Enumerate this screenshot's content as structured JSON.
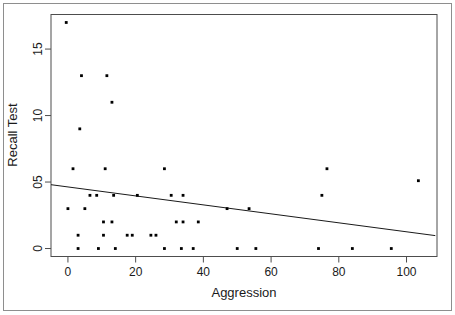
{
  "chart_data": {
    "type": "scatter",
    "title": "",
    "xlabel": "Aggression",
    "ylabel": "Recall Test",
    "xticks": [
      "0",
      "20",
      "40",
      "60",
      "80",
      "100"
    ],
    "xtick_values": [
      0,
      20,
      40,
      60,
      80,
      100
    ],
    "yticks": [
      "0",
      "05",
      "10",
      "15"
    ],
    "ytick_values": [
      0,
      5,
      10,
      15
    ],
    "xlim": [
      -5,
      109
    ],
    "ylim": [
      -0.6,
      17.6
    ],
    "grid": false,
    "legend": null,
    "point_color": "#000000",
    "line_color": "#1a1a1a",
    "axis_color": "#4d4d4d",
    "points": [
      {
        "x": -0.5,
        "y": 17.0
      },
      {
        "x": 4.0,
        "y": 13.0
      },
      {
        "x": 11.5,
        "y": 13.0
      },
      {
        "x": 13.0,
        "y": 11.0
      },
      {
        "x": 3.5,
        "y": 9.0
      },
      {
        "x": 1.5,
        "y": 6.0
      },
      {
        "x": 11.0,
        "y": 6.0
      },
      {
        "x": 28.5,
        "y": 6.0
      },
      {
        "x": 76.5,
        "y": 6.0
      },
      {
        "x": 103.5,
        "y": 5.1
      },
      {
        "x": 6.5,
        "y": 4.0
      },
      {
        "x": 8.5,
        "y": 4.0
      },
      {
        "x": 13.5,
        "y": 4.0
      },
      {
        "x": 20.5,
        "y": 4.0
      },
      {
        "x": 30.5,
        "y": 4.0
      },
      {
        "x": 34.0,
        "y": 4.0
      },
      {
        "x": 75.0,
        "y": 4.0
      },
      {
        "x": 0.0,
        "y": 3.0
      },
      {
        "x": 5.0,
        "y": 3.0
      },
      {
        "x": 47.0,
        "y": 3.0
      },
      {
        "x": 53.5,
        "y": 3.0
      },
      {
        "x": 10.5,
        "y": 2.0
      },
      {
        "x": 13.0,
        "y": 2.0
      },
      {
        "x": 32.0,
        "y": 2.0
      },
      {
        "x": 34.0,
        "y": 2.0
      },
      {
        "x": 38.5,
        "y": 2.0
      },
      {
        "x": 3.0,
        "y": 1.0
      },
      {
        "x": 10.5,
        "y": 1.0
      },
      {
        "x": 17.5,
        "y": 1.0
      },
      {
        "x": 19.0,
        "y": 1.0
      },
      {
        "x": 24.5,
        "y": 1.0
      },
      {
        "x": 26.0,
        "y": 1.0
      },
      {
        "x": 3.0,
        "y": 0.0
      },
      {
        "x": 9.0,
        "y": 0.0
      },
      {
        "x": 14.0,
        "y": 0.0
      },
      {
        "x": 28.5,
        "y": 0.0
      },
      {
        "x": 33.5,
        "y": 0.0
      },
      {
        "x": 37.0,
        "y": 0.0
      },
      {
        "x": 50.0,
        "y": 0.0
      },
      {
        "x": 55.5,
        "y": 0.0
      },
      {
        "x": 74.0,
        "y": 0.0
      },
      {
        "x": 84.0,
        "y": 0.0
      },
      {
        "x": 95.5,
        "y": 0.0
      }
    ],
    "regression_line": {
      "x_start": -5,
      "y_start": 4.8,
      "x_end": 108.5,
      "y_end": 0.97,
      "slope": -0.0338,
      "intercept": 4.63
    }
  }
}
